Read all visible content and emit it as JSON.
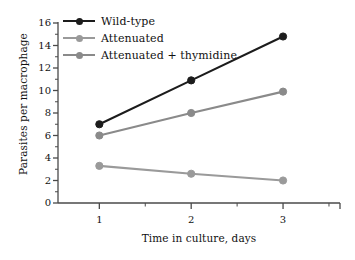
{
  "chart_data": {
    "type": "line",
    "title": "",
    "xlabel": "Time in culture, days",
    "ylabel": "Parasites per macrophage",
    "x": [
      1,
      2,
      3
    ],
    "xtick_labels": [
      "1",
      "2",
      "3"
    ],
    "ytick_labels": [
      "0",
      "2",
      "4",
      "6",
      "8",
      "10",
      "12",
      "14",
      "16"
    ],
    "ytick_values": [
      0,
      2,
      4,
      6,
      8,
      10,
      12,
      14,
      16
    ],
    "xlim": [
      0.55,
      3.62
    ],
    "ylim": [
      0,
      16
    ],
    "grid": false,
    "legend_position": "top-left-inside",
    "minor_ticks": true,
    "spines": [
      "left",
      "bottom"
    ],
    "series": [
      {
        "name": "Wild-type",
        "color": "#1c1c1c",
        "marker": "circle",
        "values": [
          7.0,
          10.9,
          14.8
        ]
      },
      {
        "name": "Attenuated",
        "color": "#9a9a9a",
        "marker": "circle",
        "values": [
          3.3,
          2.6,
          2.0
        ]
      },
      {
        "name": "Attenuated + thymidine",
        "color": "#8a8a8a",
        "marker": "circle",
        "values": [
          6.0,
          8.0,
          9.9
        ]
      }
    ]
  },
  "colors": {
    "background": "#ffffff",
    "axis": "#4a4a4a",
    "text": "#111111"
  }
}
